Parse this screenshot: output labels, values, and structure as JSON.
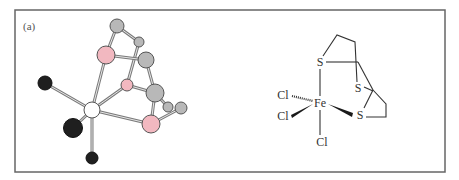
{
  "figure": {
    "panel_label": "(a)",
    "frame": {
      "x": 15,
      "y": 10,
      "width": 430,
      "height": 162,
      "stroke": "#666666"
    },
    "colors": {
      "chlorine": "#1f1f1f",
      "iron": "#ffffff",
      "sulfur": "#f2b8c0",
      "carbon": "#b8b8b8",
      "bond": "#9a9a9a",
      "outline": "#555555"
    },
    "ball_and_stick": {
      "atoms": [
        {
          "id": "C1",
          "element": "C",
          "x": 117,
          "y": 26,
          "r": 7
        },
        {
          "id": "C2",
          "element": "C",
          "x": 139,
          "y": 42,
          "r": 5
        },
        {
          "id": "S1",
          "element": "S",
          "x": 106,
          "y": 55,
          "r": 9
        },
        {
          "id": "C3",
          "element": "C",
          "x": 146,
          "y": 60,
          "r": 8
        },
        {
          "id": "S2",
          "element": "S",
          "x": 127,
          "y": 85,
          "r": 6
        },
        {
          "id": "C4",
          "element": "C",
          "x": 155,
          "y": 93,
          "r": 9
        },
        {
          "id": "C5",
          "element": "C",
          "x": 168,
          "y": 107,
          "r": 5
        },
        {
          "id": "C6",
          "element": "C",
          "x": 181,
          "y": 108,
          "r": 6
        },
        {
          "id": "S3",
          "element": "S",
          "x": 151,
          "y": 124,
          "r": 9
        },
        {
          "id": "Fe",
          "element": "Fe",
          "x": 92,
          "y": 110,
          "r": 8
        },
        {
          "id": "Cl1",
          "element": "Cl",
          "x": 45,
          "y": 83,
          "r": 7
        },
        {
          "id": "Cl2",
          "element": "Cl",
          "x": 73,
          "y": 128,
          "r": 9.5
        },
        {
          "id": "Cl3",
          "element": "Cl",
          "x": 92,
          "y": 158,
          "r": 6
        }
      ],
      "bonds": [
        [
          "Fe",
          "Cl1"
        ],
        [
          "Fe",
          "Cl2"
        ],
        [
          "Fe",
          "Cl3"
        ],
        [
          "Fe",
          "S1"
        ],
        [
          "Fe",
          "S2"
        ],
        [
          "Fe",
          "S3"
        ],
        [
          "S1",
          "C1"
        ],
        [
          "C1",
          "C2"
        ],
        [
          "C2",
          "S2"
        ],
        [
          "S1",
          "C3"
        ],
        [
          "C3",
          "C4"
        ],
        [
          "S2",
          "C4"
        ],
        [
          "C4",
          "S3"
        ],
        [
          "C4",
          "C5"
        ],
        [
          "S3",
          "C6"
        ]
      ]
    },
    "structural_formula": {
      "labels": [
        {
          "id": "S_top",
          "text": "S",
          "x": 320,
          "y": 66
        },
        {
          "id": "S_mid",
          "text": "S",
          "x": 358,
          "y": 92
        },
        {
          "id": "S_bot",
          "text": "S",
          "x": 360,
          "y": 119
        },
        {
          "id": "Fe",
          "text": "Fe",
          "x": 320,
          "y": 107
        },
        {
          "id": "Cl_upper",
          "text": "Cl",
          "x": 283,
          "y": 99
        },
        {
          "id": "Cl_lower",
          "text": "Cl",
          "x": 283,
          "y": 120
        },
        {
          "id": "Cl_bottom",
          "text": "Cl",
          "x": 322,
          "y": 146
        }
      ]
    }
  }
}
